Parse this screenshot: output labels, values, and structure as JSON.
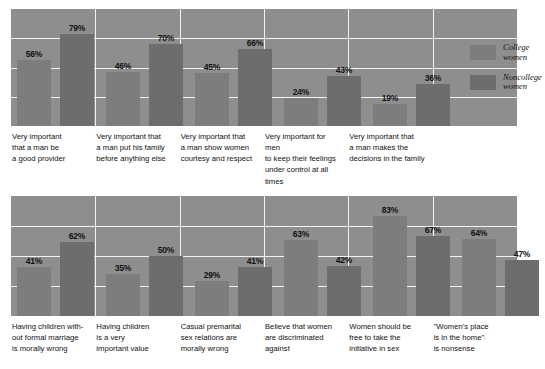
{
  "chart_data": [
    {
      "type": "bar",
      "title": "",
      "xlabel": "",
      "ylabel": "",
      "ylim": [
        0,
        100
      ],
      "grid": true,
      "gridline_values": [
        25,
        50,
        75
      ],
      "legend_position": "right-inside",
      "value_suffix": "%",
      "categories": [
        "Very important that a man be a good provider",
        "Very important that a man put his family before anything else",
        "Very important that a man show women courtesy and respect",
        "Very important for men to keep their feelings under control at all times",
        "Very important that a man makes the decisions in the family"
      ],
      "category_lines": [
        [
          "Very important",
          "that a man be",
          "a good provider"
        ],
        [
          "Very important that",
          "a man put his family",
          "before anything else"
        ],
        [
          "Very important that",
          "a man show women",
          "courtesy and respect"
        ],
        [
          "Very important for men",
          "to keep their feelings",
          "under control at all times"
        ],
        [
          "Very important that",
          "a man makes the",
          "decisions in the family"
        ]
      ],
      "series": [
        {
          "name": "College women",
          "values": [
            56,
            46,
            45,
            24,
            19
          ]
        },
        {
          "name": "Noncollege women",
          "values": [
            79,
            70,
            66,
            43,
            36
          ]
        }
      ]
    },
    {
      "type": "bar",
      "title": "",
      "xlabel": "",
      "ylabel": "",
      "ylim": [
        0,
        100
      ],
      "grid": true,
      "gridline_values": [
        25,
        50,
        75
      ],
      "legend_position": "none",
      "value_suffix": "%",
      "categories": [
        "Having children without formal marriage is morally wrong",
        "Having children is a very important value",
        "Casual premarital sex relations are morally wrong",
        "Believe that women are discriminated against",
        "Women should be free to take the initiative in sex",
        "\"Women's place is in the home\" is nonsense"
      ],
      "category_lines": [
        [
          "Having children with-",
          "out formal marriage",
          "is morally wrong"
        ],
        [
          "Having children",
          "is a very",
          "important value"
        ],
        [
          "Casual premarital",
          "sex relations are",
          "morally wrong"
        ],
        [
          "Believe that women",
          "are discriminated",
          "against"
        ],
        [
          "Women should be",
          "free to take the",
          "initiative in sex"
        ],
        [
          "\"Women's place",
          "is in the home\"",
          "is nonsense"
        ]
      ],
      "series": [
        {
          "name": "College women",
          "values": [
            41,
            35,
            29,
            63,
            83,
            64
          ]
        },
        {
          "name": "Noncollege women",
          "values": [
            62,
            50,
            41,
            42,
            67,
            47
          ]
        }
      ]
    }
  ],
  "legend": {
    "items": [
      {
        "key": "college",
        "label_lines": [
          "College",
          "women"
        ]
      },
      {
        "key": "noncollege",
        "label_lines": [
          "Noncollege",
          "women"
        ]
      }
    ]
  },
  "colors": {
    "panel_background": "#8e8e8e",
    "gridline": "#f2f2f2",
    "separator": "#f2f2f2",
    "bar_college": "#7d7d7d",
    "bar_noncollege": "#6d6d6d",
    "value_label": "#111111",
    "caption_text": "#111111",
    "page_background": "#ffffff"
  }
}
